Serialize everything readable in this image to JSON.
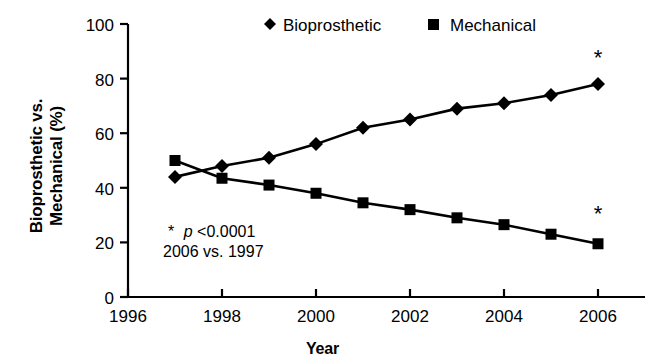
{
  "chart_data": {
    "type": "line",
    "title": "",
    "xlabel": "Year",
    "ylabel": "Bioprosthetic vs. Mechanical (%)",
    "ylabel_line1": "Bioprosthetic vs.",
    "ylabel_line2": "Mechanical (%)",
    "xlim": [
      1996,
      2007
    ],
    "ylim": [
      0,
      100
    ],
    "xticks": [
      1996,
      1998,
      2000,
      2002,
      2004,
      2006
    ],
    "xtick_labels": [
      "1996",
      "1998",
      "2000",
      "2002",
      "2004",
      "2006"
    ],
    "yticks": [
      0,
      20,
      40,
      60,
      80,
      100
    ],
    "ytick_labels": [
      "0",
      "20",
      "40",
      "60",
      "80",
      "100"
    ],
    "grid": false,
    "legend_position": "top-center",
    "x": [
      1997,
      1998,
      1999,
      2000,
      2001,
      2002,
      2003,
      2004,
      2005,
      2006
    ],
    "series": [
      {
        "name": "Bioprosthetic",
        "marker": "diamond",
        "values": [
          44,
          48,
          51,
          56,
          62,
          65,
          69,
          71,
          74,
          78
        ]
      },
      {
        "name": "Mechanical",
        "marker": "square",
        "values": [
          50,
          43.5,
          41,
          38,
          34.5,
          32,
          29,
          26.5,
          23,
          19.5
        ]
      }
    ],
    "annotations": [
      {
        "text": "*",
        "x": 2006,
        "y": 85
      },
      {
        "text": "*",
        "x": 2006,
        "y": 28
      }
    ],
    "note_line1_marker": "*",
    "note_line1_italic": "p",
    "note_line1_rest": "<0.0001",
    "note_line2": "2006 vs. 1997",
    "colors": {
      "series": "#000000",
      "axis": "#000000",
      "background": "#ffffff"
    }
  },
  "legend": {
    "items": [
      {
        "label": "Bioprosthetic",
        "marker": "diamond"
      },
      {
        "label": "Mechanical",
        "marker": "square"
      }
    ]
  }
}
